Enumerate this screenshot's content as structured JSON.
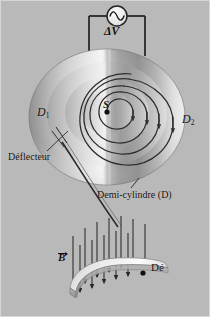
{
  "figure": {
    "background_color": "#b9b9b9",
    "ink_color": "#14110f",
    "width": 210,
    "height": 317
  },
  "labels": {
    "voltage": "ΔV",
    "source_point": "S",
    "dee_left": "D",
    "dee_left_sub": "1",
    "dee_right": "D",
    "dee_right_sub": "2",
    "deflector": "Déflecteur",
    "half_cylinder": "Demi-cylindre (D)",
    "dee_plate": "Dé",
    "magnetic_field": "B"
  },
  "icons": {
    "ac_source": "ac-source-sine-icon",
    "beam_dot": "particle-dot-icon",
    "field_arrow": "field-arrow-down-icon",
    "spiral_arrow": "spiral-direction-arrow-icon"
  },
  "components": {
    "ac_source": {
      "name": "alternating-voltage-source",
      "cx": 117,
      "cy": 16,
      "r": 10
    },
    "circuit_wires": {
      "left_x": 89,
      "right_x": 145,
      "top_y": 16,
      "bottom_y": 52
    },
    "disc": {
      "name": "cyclotron-dees-disc",
      "cx": 107,
      "cy": 117,
      "rx": 78,
      "ry": 68
    },
    "spiral": {
      "name": "particle-spiral-trajectory",
      "turns": 4,
      "center_x": 107,
      "center_y": 112
    },
    "deflector_line": {
      "name": "deflector-electrode",
      "x1": 63,
      "y1": 146,
      "x2": 118,
      "y2": 226
    },
    "dee_plate": {
      "name": "lower-dee-plate",
      "cx": 118,
      "cy": 277
    },
    "field_arrows": {
      "count": 12,
      "direction": "down"
    }
  }
}
